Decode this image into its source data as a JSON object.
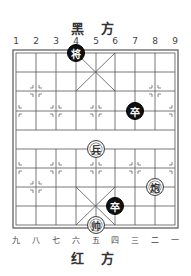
{
  "top_side_label": "黑 方",
  "bottom_side_label": "红 方",
  "top_file_labels": [
    "1",
    "2",
    "3",
    "4",
    "5",
    "6",
    "7",
    "8",
    "9"
  ],
  "bottom_file_labels": [
    "九",
    "八",
    "七",
    "六",
    "五",
    "四",
    "三",
    "二",
    "一"
  ],
  "colors": {
    "black_piece": "#111111",
    "red_piece_bg": "#ffffff",
    "grid": "#555555"
  },
  "pieces": [
    {
      "char": "将",
      "side": "black",
      "file": 3,
      "rank": 0
    },
    {
      "char": "卒",
      "side": "black",
      "file": 6,
      "rank": 3
    },
    {
      "char": "兵",
      "side": "red",
      "file": 4,
      "rank": 5
    },
    {
      "char": "炮",
      "side": "red",
      "file": 7,
      "rank": 7
    },
    {
      "char": "卒",
      "side": "black",
      "file": 5,
      "rank": 8
    },
    {
      "char": "帅",
      "side": "red",
      "file": 4,
      "rank": 9
    }
  ]
}
